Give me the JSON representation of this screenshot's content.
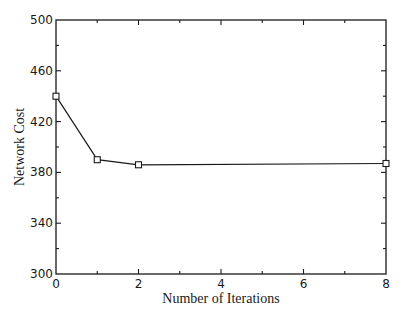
{
  "chart_data": {
    "type": "line",
    "title": "",
    "xlabel": "Number of Iterations",
    "ylabel": "Network Cost",
    "xlim": [
      0,
      8
    ],
    "ylim": [
      300,
      500
    ],
    "x_ticks": [
      0,
      2,
      4,
      6,
      8
    ],
    "x_tick_labels": [
      "0",
      "2",
      "4",
      "6",
      "8"
    ],
    "y_ticks": [
      300,
      340,
      380,
      420,
      460,
      500
    ],
    "y_tick_labels": [
      "300",
      "340",
      "380",
      "420",
      "460",
      "500"
    ],
    "grid": false,
    "legend": null,
    "series": [
      {
        "name": "Network Cost",
        "marker": "square",
        "color": "#1a1a1a",
        "x": [
          0,
          1,
          2,
          8
        ],
        "y": [
          440,
          390,
          386,
          387
        ]
      }
    ]
  }
}
